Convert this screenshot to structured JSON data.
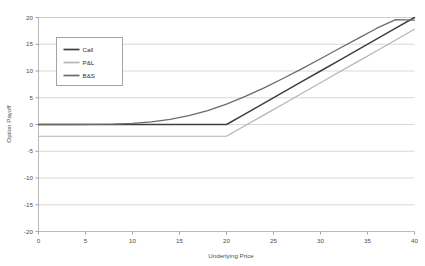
{
  "chart_data": {
    "type": "line",
    "title": "",
    "xlabel": "Underlying Price",
    "ylabel": "Option Payoff",
    "xlim": [
      0,
      40
    ],
    "ylim": [
      -20,
      20
    ],
    "grid": "horizontal",
    "legend_position": "upper-left-inside",
    "xticks": [
      "0",
      "5",
      "10",
      "15",
      "20",
      "25",
      "30",
      "35",
      "40"
    ],
    "yticks": [
      "20",
      "15",
      "10",
      "5",
      "0",
      "-5",
      "-10",
      "-15",
      "-20"
    ],
    "strike": 20,
    "premium": 2.2,
    "series": [
      {
        "name": "Call",
        "color": "#3f3f3f",
        "width": 1.5,
        "x": [
          0,
          2,
          4,
          6,
          8,
          10,
          12,
          14,
          16,
          18,
          20,
          22,
          24,
          26,
          28,
          30,
          32,
          34,
          36,
          38,
          40
        ],
        "values": [
          0,
          0,
          0,
          0,
          0,
          0,
          0,
          0,
          0,
          0,
          0,
          2,
          4,
          6,
          8,
          10,
          12,
          14,
          16,
          18,
          20
        ]
      },
      {
        "name": "P&L",
        "color": "#b4b4b4",
        "width": 1.2,
        "x": [
          0,
          2,
          4,
          6,
          8,
          10,
          12,
          14,
          16,
          18,
          20,
          22,
          24,
          26,
          28,
          30,
          32,
          34,
          36,
          38,
          40
        ],
        "values": [
          -2.2,
          -2.2,
          -2.2,
          -2.2,
          -2.2,
          -2.2,
          -2.2,
          -2.2,
          -2.2,
          -2.2,
          -2.2,
          -0.2,
          1.8,
          3.8,
          5.8,
          7.8,
          9.8,
          11.8,
          13.8,
          15.8,
          17.8
        ]
      },
      {
        "name": "B&S",
        "color": "#6b6b6b",
        "width": 1.3,
        "x": [
          0,
          2,
          4,
          6,
          8,
          10,
          12,
          14,
          16,
          18,
          20,
          22,
          24,
          26,
          28,
          30,
          32,
          34,
          36,
          38,
          40
        ],
        "values": [
          0.0,
          0.0,
          0.0,
          0.02,
          0.08,
          0.22,
          0.5,
          0.95,
          1.65,
          2.6,
          3.8,
          5.25,
          6.85,
          8.6,
          10.4,
          12.3,
          14.2,
          16.1,
          18.0,
          19.6,
          19.5
        ]
      }
    ],
    "legend": [
      {
        "label": "Call",
        "color": "#3f3f3f"
      },
      {
        "label": "P&L",
        "color": "#b4b4b4"
      },
      {
        "label": "B&S",
        "color": "#6b6b6b"
      }
    ]
  },
  "axes": {
    "x_title": "Underlying Price",
    "y_title": "Option Payoff"
  },
  "header": {
    "cropped_text": ""
  }
}
